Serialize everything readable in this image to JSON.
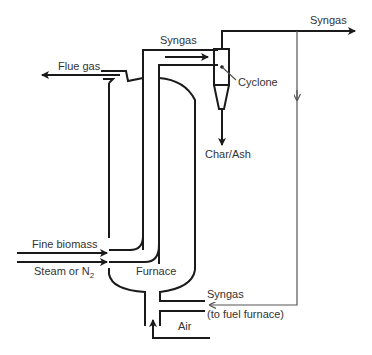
{
  "diagram": {
    "type": "dual fluidized bed gasifier process schematic",
    "labels": {
      "syngas_top": "Syngas",
      "syngas_outlet": "Syngas",
      "flue_gas": "Flue gas",
      "cyclone": "Cyclone",
      "char_ash": "Char/Ash",
      "fine_biomass": "Fine biomass",
      "steam_or_n2": "Steam or N",
      "steam_subscript": "2",
      "furnace": "Furnace",
      "syngas_recycle": "Syngas",
      "to_fuel_furnace": "(to fuel furnace)",
      "air": "Air"
    },
    "components": [
      "Riser gasifier",
      "Cyclone",
      "Furnace",
      "Syngas recycle line",
      "Air inlet"
    ],
    "flows": [
      {
        "from": "Riser",
        "to": "Cyclone",
        "label": "Syngas"
      },
      {
        "from": "Cyclone",
        "to": "outlet",
        "label": "Syngas"
      },
      {
        "from": "Cyclone",
        "to": "bottom",
        "label": "Char/Ash"
      },
      {
        "from": "Furnace",
        "to": "outlet",
        "label": "Flue gas"
      },
      {
        "from": "inlet",
        "to": "Riser",
        "label": "Fine biomass"
      },
      {
        "from": "inlet",
        "to": "Riser",
        "label": "Steam or N2"
      },
      {
        "from": "Syngas outlet",
        "to": "Furnace",
        "label": "Syngas (to fuel furnace)"
      },
      {
        "from": "inlet",
        "to": "Furnace",
        "label": "Air"
      }
    ]
  }
}
